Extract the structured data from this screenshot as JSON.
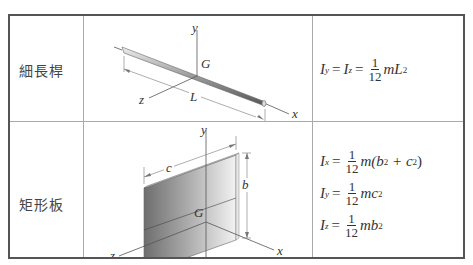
{
  "table": {
    "rows": [
      {
        "shape_label": "細長桿",
        "figure": {
          "type": "slender-rod",
          "axis_labels": {
            "x": "x",
            "y": "y",
            "z": "z",
            "center": "G",
            "length": "L"
          }
        },
        "formulas": [
          {
            "lhs": "I",
            "lhs_sub": "y",
            "mid": "I",
            "mid_sub": "z",
            "num": "1",
            "den": "12",
            "rhs": "mL",
            "rhs_sup": "2"
          }
        ]
      },
      {
        "shape_label": "矩形板",
        "figure": {
          "type": "rectangular-plate",
          "axis_labels": {
            "x": "x",
            "y": "y",
            "z": "z",
            "center": "G",
            "width": "c",
            "height": "b"
          }
        },
        "formulas": [
          {
            "lhs": "I",
            "lhs_sub": "x",
            "num": "1",
            "den": "12",
            "rhs_pre": "m(b",
            "sup1": "2",
            "rhs_mid": " + c",
            "sup2": "2",
            "rhs_post": ")"
          },
          {
            "lhs": "I",
            "lhs_sub": "y",
            "num": "1",
            "den": "12",
            "rhs": "mc",
            "rhs_sup": "2"
          },
          {
            "lhs": "I",
            "lhs_sub": "z",
            "num": "1",
            "den": "12",
            "rhs": "mb",
            "rhs_sup": "2"
          }
        ]
      }
    ],
    "symbols": {
      "equals": "="
    }
  },
  "colors": {
    "border": "#555555",
    "grid": "#aaaaaa",
    "plate_dark": "#6e6e6e",
    "plate_light": "#f2f2f2"
  }
}
